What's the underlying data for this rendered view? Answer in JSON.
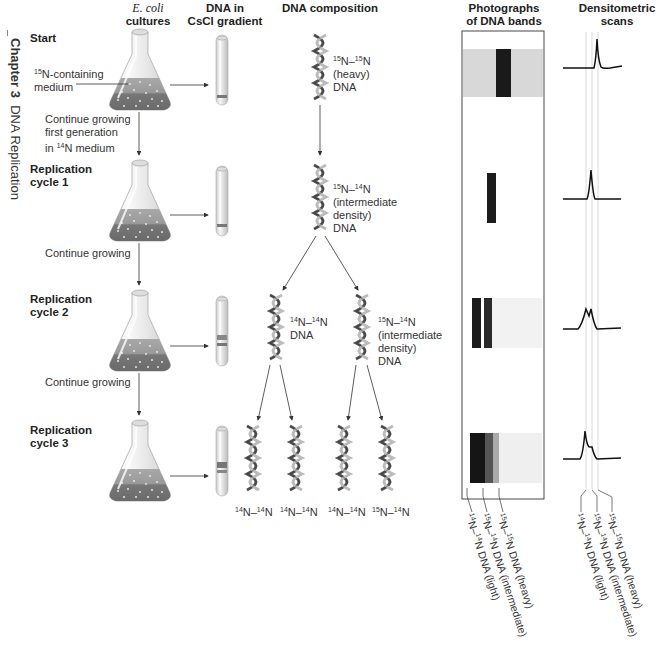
{
  "sidebar": {
    "chapter_label": "Chapter 3",
    "chapter_title": "DNA Replication"
  },
  "headers": {
    "cultures_species": "E. coli",
    "cultures": "cultures",
    "gradient_line1": "DNA in",
    "gradient_line2": "CsCl gradient",
    "composition": "DNA composition",
    "photos_line1": "Photographs",
    "photos_line2": "of DNA bands",
    "scans_line1": "Densitometric",
    "scans_line2": "scans"
  },
  "stages": [
    {
      "label_line1": "Start",
      "label_line2": ""
    },
    {
      "label_line1": "Replication",
      "label_line2": "cycle 1"
    },
    {
      "label_line1": "Replication",
      "label_line2": "cycle 2"
    },
    {
      "label_line1": "Replication",
      "label_line2": "cycle 3"
    }
  ],
  "annotations": {
    "medium_sup": "15",
    "medium_line1_rest": "N-containing",
    "medium_line2": "medium",
    "transition1_line1": "Continue growing",
    "transition1_line2": "first generation",
    "transition1_line3_pre": "in ",
    "transition1_line3_sup": "14",
    "transition1_line3_rest": "N medium",
    "transition2": "Continue growing",
    "transition3": "Continue growing"
  },
  "composition": {
    "start": {
      "sup1": "15",
      "mid": "N–",
      "sup2": "15",
      "end": "N",
      "line2": "(heavy)",
      "line3": "DNA"
    },
    "cycle1": {
      "sup1": "15",
      "mid": "N–",
      "sup2": "14",
      "end": "N",
      "line2": "(intermediate",
      "line3": "density)",
      "line4": "DNA"
    },
    "cycle2_left": {
      "sup1": "14",
      "mid": "N–",
      "sup2": "14",
      "end": "N",
      "line2": "DNA"
    },
    "cycle2_right": {
      "sup1": "15",
      "mid": "N–",
      "sup2": "14",
      "end": "N",
      "line2": "(intermediate",
      "line3": "density)",
      "line4": "DNA"
    },
    "cycle3": [
      {
        "sup1": "14",
        "mid": "N–",
        "sup2": "14",
        "end": "N"
      },
      {
        "sup1": "14",
        "mid": "N–",
        "sup2": "14",
        "end": "N"
      },
      {
        "sup1": "14",
        "mid": "N–",
        "sup2": "14",
        "end": "N"
      },
      {
        "sup1": "15",
        "mid": "N–",
        "sup2": "14",
        "end": "N"
      }
    ]
  },
  "band_legend": [
    {
      "sup1": "14",
      "mid": "N–",
      "sup2": "14",
      "end": "N DNA (light)"
    },
    {
      "sup1": "15",
      "mid": "N–",
      "sup2": "14",
      "end": "N DNA (intermediate)"
    },
    {
      "sup1": "15",
      "mid": "N–",
      "sup2": "15",
      "end": "N DNA (heavy)"
    }
  ],
  "colors": {
    "text": "#222222",
    "band_dark": "#1a1a1a",
    "medium_fill": "#8a8a8a",
    "scan_line": "#111111",
    "guide_line": "#c8c8c8",
    "arrow": "#333333"
  }
}
